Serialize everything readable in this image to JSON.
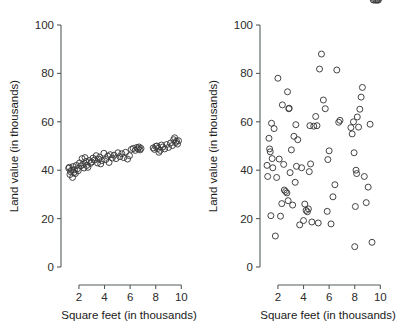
{
  "figure": {
    "background": "#ffffff",
    "marker_color": "#3a3a3a",
    "axis_color": "#555c5c",
    "marker_shape": "open-circle",
    "marker_radius_px": 3.0
  },
  "chart_data": [
    {
      "type": "scatter",
      "title": "",
      "panel": "left",
      "xlabel": "Square feet (in thousands)",
      "ylabel": "Land value (in thousands)",
      "xlim": [
        0.6,
        10.6
      ],
      "ylim": [
        0,
        100
      ],
      "xticks": [
        2,
        4,
        6,
        8,
        10
      ],
      "yticks": [
        0,
        20,
        40,
        60,
        80,
        100
      ],
      "xticklabels": [
        "2",
        "4",
        "6",
        "8",
        "10"
      ],
      "yticklabels": [
        "0",
        "20",
        "40",
        "60",
        "80",
        "100"
      ],
      "grid": false,
      "legend": null,
      "relationship": "strong positive linear correlation",
      "x": [
        1.2,
        1.25,
        1.3,
        1.35,
        1.42,
        1.5,
        1.55,
        1.6,
        1.65,
        1.72,
        1.8,
        1.88,
        1.95,
        2.05,
        2.15,
        2.25,
        2.32,
        2.4,
        2.48,
        2.55,
        2.62,
        2.7,
        2.8,
        2.9,
        3.0,
        3.1,
        3.22,
        3.35,
        3.45,
        3.55,
        3.62,
        3.7,
        3.8,
        3.95,
        4.1,
        4.25,
        4.35,
        4.45,
        4.6,
        4.75,
        4.9,
        5.05,
        5.2,
        5.35,
        5.5,
        5.65,
        5.8,
        5.95,
        6.1,
        6.25,
        6.4,
        6.52,
        6.62,
        6.7,
        6.78,
        6.85,
        7.8,
        7.9,
        8.0,
        8.1,
        8.18,
        8.25,
        8.35,
        8.45,
        8.55,
        8.7,
        8.85,
        9.0,
        9.15,
        9.3,
        9.4,
        9.48,
        9.55,
        9.62,
        9.7,
        9.78
      ],
      "y": [
        40.8,
        41.2,
        38.2,
        39.4,
        40.0,
        37.0,
        41.5,
        39.0,
        40.2,
        38.6,
        42.0,
        40.6,
        39.8,
        43.0,
        41.8,
        44.8,
        42.4,
        40.9,
        45.2,
        43.6,
        42.0,
        41.2,
        44.0,
        42.8,
        43.4,
        45.0,
        44.2,
        46.0,
        43.0,
        44.6,
        45.4,
        42.6,
        44.0,
        47.0,
        44.4,
        45.8,
        43.2,
        46.4,
        45.0,
        46.2,
        44.8,
        47.2,
        45.6,
        46.8,
        45.2,
        47.4,
        44.6,
        46.0,
        48.6,
        49.0,
        48.2,
        49.4,
        48.8,
        49.6,
        48.4,
        49.0,
        49.2,
        48.6,
        49.8,
        50.0,
        49.0,
        47.4,
        48.2,
        50.4,
        49.6,
        48.8,
        50.6,
        49.4,
        51.2,
        50.2,
        52.6,
        53.4,
        51.4,
        52.0,
        50.8,
        52.2
      ]
    },
    {
      "type": "scatter",
      "title": "",
      "panel": "right",
      "xlabel": "Square feet (in thousands)",
      "ylabel": "Land value (in thousands)",
      "xlim": [
        0.6,
        10.6
      ],
      "ylim": [
        0,
        100
      ],
      "xticks": [
        2,
        4,
        6,
        8,
        10
      ],
      "yticks": [
        0,
        20,
        40,
        60,
        80,
        100
      ],
      "xticklabels": [
        "2",
        "4",
        "6",
        "8",
        "10"
      ],
      "yticklabels": [
        "0",
        "20",
        "40",
        "60",
        "80",
        "100"
      ],
      "grid": false,
      "legend": null,
      "relationship": "no correlation / random scatter",
      "x": [
        1.15,
        1.2,
        1.3,
        1.35,
        1.4,
        1.45,
        1.5,
        1.55,
        1.6,
        1.7,
        1.8,
        1.9,
        2.0,
        2.1,
        2.2,
        2.3,
        2.35,
        2.45,
        2.5,
        2.6,
        2.7,
        2.75,
        2.8,
        2.85,
        2.88,
        2.95,
        3.05,
        3.15,
        3.25,
        3.35,
        3.4,
        3.45,
        3.55,
        3.7,
        3.85,
        4.0,
        4.1,
        4.2,
        4.3,
        4.38,
        4.45,
        4.5,
        4.55,
        4.65,
        4.8,
        4.95,
        5.05,
        5.15,
        5.25,
        5.4,
        5.55,
        5.7,
        5.85,
        5.9,
        6.0,
        6.15,
        6.3,
        6.45,
        6.6,
        6.75,
        6.85,
        7.7,
        7.8,
        7.9,
        7.95,
        8.0,
        8.05,
        8.1,
        8.15,
        8.2,
        8.3,
        8.4,
        8.5,
        8.6,
        8.75,
        8.9,
        9.05,
        9.2,
        9.35,
        9.45,
        9.55,
        9.65,
        9.72,
        9.8,
        9.85
      ],
      "y": [
        42.0,
        37.4,
        53.2,
        48.8,
        47.6,
        21.2,
        59.4,
        44.8,
        41.0,
        57.2,
        12.8,
        37.0,
        78.0,
        44.6,
        21.0,
        26.2,
        67.0,
        42.4,
        31.8,
        31.2,
        30.6,
        72.4,
        27.4,
        65.4,
        65.6,
        39.0,
        48.4,
        25.6,
        54.0,
        35.0,
        58.8,
        41.6,
        52.6,
        17.4,
        41.0,
        19.2,
        26.0,
        23.4,
        22.8,
        24.0,
        39.4,
        58.4,
        42.6,
        18.6,
        58.2,
        62.2,
        58.4,
        18.2,
        81.8,
        88.0,
        69.0,
        65.4,
        23.0,
        44.4,
        48.0,
        17.8,
        29.0,
        34.0,
        81.4,
        59.8,
        60.6,
        57.6,
        55.0,
        60.0,
        47.2,
        8.4,
        25.0,
        40.0,
        38.6,
        62.0,
        57.8,
        65.2,
        70.2,
        74.2,
        37.4,
        26.6,
        33.0,
        59.0,
        10.2
      ]
    }
  ]
}
